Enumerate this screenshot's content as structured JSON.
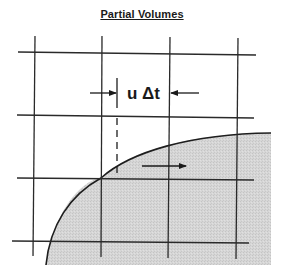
{
  "diagram": {
    "title": "Partial Volumes",
    "label": "u Δt",
    "grid": {
      "vertical_lines_x": [
        35,
        102,
        170,
        238
      ],
      "horizontal_lines_y": [
        53,
        116,
        179,
        242
      ]
    },
    "colors": {
      "line": "#2a2a2a",
      "shaded_region": "#d4d4d4",
      "background": "#ffffff"
    },
    "annotations": {
      "measure_arrow_left": "arrow pointing right toward dashed line",
      "measure_arrow_right": "arrow pointing left toward grid line",
      "flow_arrow": "arrow pointing right inside shaded region"
    }
  }
}
